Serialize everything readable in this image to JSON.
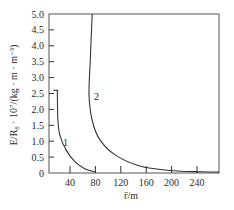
{
  "chart_data": {
    "type": "line",
    "title": "",
    "xlabel": "r̄/m",
    "ylabel": "E/R₀ · 10⁷/(kg · m · m⁻³)",
    "xlim": [
      10,
      280
    ],
    "ylim": [
      0,
      5.0
    ],
    "x_ticks": [
      40,
      80,
      120,
      160,
      200,
      240
    ],
    "y_ticks": [
      0,
      0.5,
      1.0,
      1.5,
      2.0,
      2.5,
      3.0,
      3.5,
      4.0,
      4.5,
      5.0
    ],
    "y_tick_labels": [
      "0",
      "0.5",
      "1.0",
      "1.5",
      "2.0",
      "2.5",
      "3.0",
      "3.5",
      "4.0",
      "4.5",
      "5.0"
    ],
    "grid": false,
    "legend": "inline curve labels",
    "series": [
      {
        "name": "1",
        "x": [
          20,
          21,
          24,
          34,
          48,
          64,
          80
        ],
        "y": [
          2.6,
          1.65,
          1.2,
          0.72,
          0.35,
          0.13,
          0.03
        ]
      },
      {
        "name": "2",
        "x": [
          75,
          72,
          70,
          75,
          87,
          111,
          150,
          197,
          245,
          275
        ],
        "y": [
          5.0,
          3.55,
          2.45,
          1.65,
          1.05,
          0.57,
          0.22,
          0.08,
          0.04,
          0.03
        ]
      }
    ],
    "annotations": [
      {
        "text": "1",
        "x": 30,
        "y": 1.0
      },
      {
        "text": "2",
        "x": 80,
        "y": 2.4
      }
    ]
  },
  "axes": {
    "x_title": "r̄/m",
    "y_title": "E/R₀ · 10⁷/(kg · m · m⁻³)",
    "x_tick_labels": [
      "40",
      "80",
      "120",
      "160",
      "200",
      "240"
    ],
    "y_tick_labels": [
      "0",
      "0.5",
      "1.0",
      "1.5",
      "2.0",
      "2.5",
      "3.0",
      "3.5",
      "4.0",
      "4.5",
      "5.0"
    ]
  },
  "labels": {
    "curve1": "1",
    "curve2": "2"
  }
}
